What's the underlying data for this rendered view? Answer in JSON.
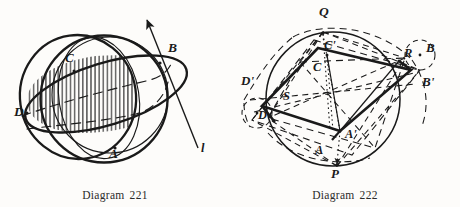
{
  "page": {
    "background": "#fdfcfa",
    "ink": "#1a1a1a",
    "width": 460,
    "height": 207
  },
  "figures": [
    {
      "id": "diagram-221",
      "caption_word": "Diagram",
      "caption_number": "221",
      "description": "Sphere with two great circles intersecting at A and B; shaded lune hatched with vertical lines; line l tangent/secant through B with arrowhead",
      "labels": [
        {
          "name": "label-C",
          "text": "C",
          "x": 65,
          "y": 62
        },
        {
          "name": "label-B",
          "text": "B",
          "x": 168,
          "y": 52
        },
        {
          "name": "label-D",
          "text": "D",
          "x": 14,
          "y": 116
        },
        {
          "name": "label-A",
          "text": "A",
          "x": 109,
          "y": 158
        },
        {
          "name": "label-l",
          "text": "l",
          "x": 201,
          "y": 152
        }
      ]
    },
    {
      "id": "diagram-222",
      "caption_word": "Diagram",
      "caption_number": "222",
      "description": "Circle with inscribed quadrilateral ABCD and its image A'B'C'D'; diagonal points P, Q, R, S marked on and near the circle; dashed construction lines and dotted lines to P and Q",
      "labels": [
        {
          "name": "label-Q",
          "text": "Q",
          "x": 89,
          "y": 16
        },
        {
          "name": "label-C-prime",
          "text": "C'",
          "x": 94,
          "y": 49
        },
        {
          "name": "label-C",
          "text": "C",
          "x": 83,
          "y": 71
        },
        {
          "name": "label-R",
          "text": "R",
          "x": 174,
          "y": 57
        },
        {
          "name": "label-B",
          "text": "B",
          "x": 196,
          "y": 52
        },
        {
          "name": "label-B-prime",
          "text": "B'",
          "x": 192,
          "y": 86
        },
        {
          "name": "label-D-prime",
          "text": "D'",
          "x": 11,
          "y": 85
        },
        {
          "name": "label-S",
          "text": "S",
          "x": 53,
          "y": 100
        },
        {
          "name": "label-D",
          "text": "D",
          "x": 28,
          "y": 119
        },
        {
          "name": "label-A-prime",
          "text": "A'",
          "x": 115,
          "y": 138
        },
        {
          "name": "label-A",
          "text": "A",
          "x": 85,
          "y": 154
        },
        {
          "name": "label-P",
          "text": "P",
          "x": 101,
          "y": 178
        }
      ]
    }
  ]
}
